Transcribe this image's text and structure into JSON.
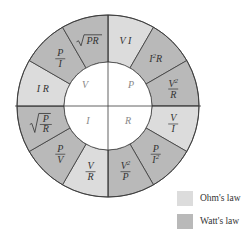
{
  "diagram": {
    "center_quadrants": [
      {
        "id": "V",
        "label": "V"
      },
      {
        "id": "P",
        "label": "P"
      },
      {
        "id": "I",
        "label": "I"
      },
      {
        "id": "R",
        "label": "R"
      }
    ],
    "segments": [
      {
        "quantity": "P",
        "formula": "VI",
        "law": "ohm"
      },
      {
        "quantity": "P",
        "formula": "I²R",
        "law": "watt"
      },
      {
        "quantity": "P",
        "formula": "V²/R",
        "law": "watt"
      },
      {
        "quantity": "R",
        "formula": "V/I",
        "law": "ohm"
      },
      {
        "quantity": "R",
        "formula": "P/I²",
        "law": "watt"
      },
      {
        "quantity": "R",
        "formula": "V²/P",
        "law": "watt"
      },
      {
        "quantity": "I",
        "formula": "V/R",
        "law": "ohm"
      },
      {
        "quantity": "I",
        "formula": "P/V",
        "law": "watt"
      },
      {
        "quantity": "I",
        "formula": "√(P/R)",
        "law": "watt"
      },
      {
        "quantity": "V",
        "formula": "IR",
        "law": "ohm"
      },
      {
        "quantity": "V",
        "formula": "P/I",
        "law": "watt"
      },
      {
        "quantity": "V",
        "formula": "√(PR)",
        "law": "watt"
      }
    ],
    "colors": {
      "ohm": "#dcdcdc",
      "watt": "#b9b9b9",
      "inner": "#ffffff",
      "stroke": "#3a3a3a"
    }
  },
  "legend": {
    "items": [
      {
        "label": "Ohm's law",
        "color": "#dcdcdc"
      },
      {
        "label": "Watt's law",
        "color": "#b9b9b9"
      }
    ]
  }
}
